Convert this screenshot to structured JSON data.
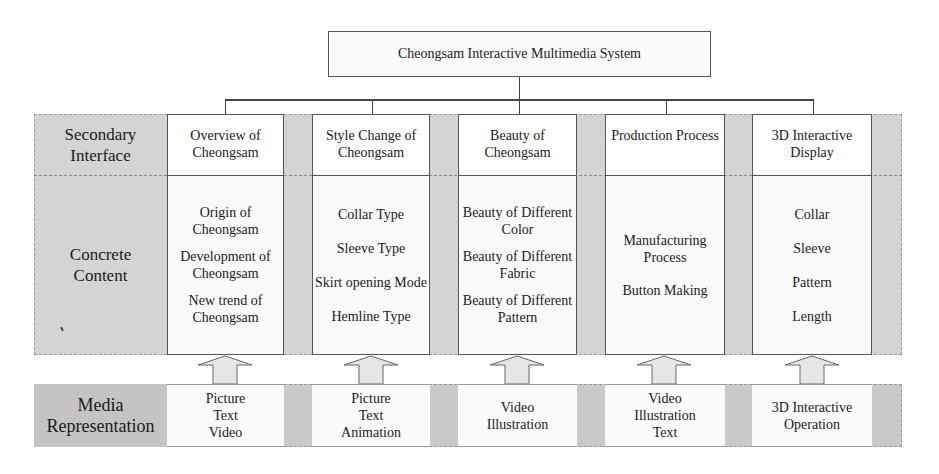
{
  "diagram": {
    "root": "Cheongsam Interactive Multimedia System",
    "row_labels": {
      "secondary": "Secondary\nInterface",
      "concrete": "Concrete\nContent",
      "media": "Media\nRepresentation"
    },
    "columns": [
      {
        "title": "Overview of\nCheongsam",
        "content": [
          "Origin of\nCheongsam",
          "Development of\nCheongsam",
          "New trend of\nCheongsam"
        ],
        "media": "Picture\nText\nVideo"
      },
      {
        "title": "Style Change of\nCheongsam",
        "content": [
          "Collar Type",
          "Sleeve Type",
          "Skirt opening Mode",
          "Hemline Type"
        ],
        "media": "Picture\nText\nAnimation"
      },
      {
        "title": "Beauty of\nCheongsam",
        "content": [
          "Beauty of Different\nColor",
          "Beauty of Different\nFabric",
          "Beauty of Different\nPattern"
        ],
        "media": "Video\nIllustration"
      },
      {
        "title": "Production Process",
        "content": [
          "Manufacturing\nProcess",
          "Button Making"
        ],
        "media": "Video\nIllustration\nText"
      },
      {
        "title": "3D Interactive\nDisplay",
        "content": [
          "Collar",
          "Sleeve",
          "Pattern",
          "Length"
        ],
        "media": "3D Interactive\nOperation"
      }
    ],
    "colors": {
      "band_gray": "#d4d4d4",
      "media_gray": "#c9c9c9",
      "box_white": "#ffffff",
      "line": "#444444",
      "arrow_fill": "#e6e6e6"
    }
  }
}
